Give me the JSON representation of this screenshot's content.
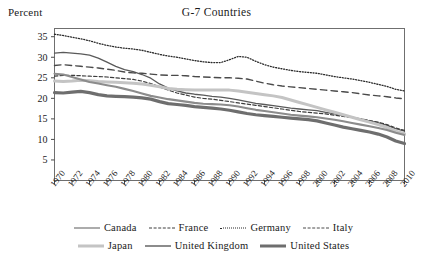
{
  "chart_data": {
    "type": "line",
    "title": "G-7 Countries",
    "ylabel": "Percent",
    "xlabel": "",
    "ylim": [
      0,
      37
    ],
    "xlim": [
      1970,
      2010
    ],
    "grid": false,
    "legend_position": "bottom",
    "yticks": [
      5,
      10,
      15,
      20,
      25,
      30,
      35
    ],
    "xticks": [
      1970,
      1972,
      1974,
      1976,
      1978,
      1980,
      1982,
      1984,
      1986,
      1988,
      1990,
      1992,
      1994,
      1996,
      1998,
      2000,
      2002,
      2004,
      2006,
      2008,
      2010
    ],
    "x": [
      1970,
      1971,
      1972,
      1973,
      1974,
      1975,
      1976,
      1977,
      1978,
      1979,
      1980,
      1981,
      1982,
      1983,
      1984,
      1985,
      1986,
      1987,
      1988,
      1989,
      1990,
      1991,
      1992,
      1993,
      1994,
      1995,
      1996,
      1997,
      1998,
      1999,
      2000,
      2001,
      2002,
      2003,
      2004,
      2005,
      2006,
      2007,
      2008,
      2009,
      2010
    ],
    "series": [
      {
        "name": "Canada",
        "style": "solid-thin",
        "color": "#5a5a5a",
        "width": 1.3,
        "values": [
          31.0,
          31.2,
          31.0,
          30.8,
          30.5,
          29.8,
          28.8,
          27.8,
          27.0,
          26.5,
          25.8,
          24.9,
          23.5,
          22.5,
          21.8,
          21.3,
          21.0,
          20.8,
          20.5,
          20.3,
          20.0,
          19.6,
          19.2,
          18.8,
          18.5,
          18.2,
          17.9,
          17.6,
          17.4,
          17.2,
          17.0,
          16.6,
          16.2,
          15.8,
          15.4,
          15.0,
          14.5,
          14.0,
          13.4,
          12.6,
          12.0
        ]
      },
      {
        "name": "France",
        "style": "dashed",
        "color": "#3d3d3d",
        "width": 1.2,
        "values": [
          25.4,
          25.6,
          25.6,
          25.5,
          25.4,
          25.3,
          25.2,
          25.0,
          24.8,
          24.6,
          24.2,
          23.6,
          22.8,
          22.0,
          21.3,
          20.8,
          20.3,
          20.0,
          19.8,
          19.5,
          19.2,
          18.9,
          18.6,
          18.3,
          18.0,
          17.7,
          17.4,
          17.1,
          16.8,
          16.6,
          16.4,
          16.2,
          15.9,
          15.6,
          15.3,
          15.0,
          14.6,
          14.2,
          13.6,
          12.8,
          12.2
        ]
      },
      {
        "name": "Germany",
        "style": "dotted",
        "color": "#2b2b2b",
        "width": 1.3,
        "values": [
          35.6,
          35.3,
          34.9,
          34.5,
          34.0,
          33.4,
          32.9,
          32.5,
          32.2,
          32.0,
          31.7,
          31.2,
          30.7,
          30.3,
          30.0,
          29.6,
          29.2,
          28.9,
          28.7,
          28.7,
          29.4,
          30.2,
          30.0,
          29.0,
          28.2,
          27.6,
          27.2,
          26.8,
          26.5,
          26.3,
          26.1,
          25.7,
          25.3,
          25.0,
          24.7,
          24.3,
          23.9,
          23.4,
          22.9,
          22.2,
          21.8
        ]
      },
      {
        "name": "Italy",
        "style": "longdash",
        "color": "#4a4a4a",
        "width": 1.4,
        "values": [
          28.0,
          28.2,
          28.0,
          27.8,
          27.6,
          27.4,
          27.1,
          26.8,
          26.4,
          26.2,
          26.1,
          25.9,
          25.7,
          25.6,
          25.6,
          25.5,
          25.3,
          25.2,
          25.1,
          25.0,
          25.0,
          24.9,
          24.7,
          24.2,
          23.7,
          23.3,
          23.0,
          22.8,
          22.6,
          22.4,
          22.2,
          22.0,
          21.8,
          21.6,
          21.4,
          21.1,
          20.8,
          20.6,
          20.4,
          20.1,
          19.9
        ]
      },
      {
        "name": "Japan",
        "style": "solid-thick",
        "color": "#c4c4c4",
        "width": 3.0,
        "values": [
          24.2,
          24.1,
          24.2,
          24.4,
          24.3,
          24.1,
          24.0,
          23.9,
          23.8,
          23.7,
          23.5,
          23.2,
          22.8,
          22.4,
          22.2,
          22.1,
          22.0,
          22.0,
          22.0,
          22.0,
          22.0,
          21.8,
          21.5,
          21.2,
          20.9,
          20.6,
          20.2,
          19.6,
          19.0,
          18.4,
          17.8,
          17.2,
          16.6,
          16.0,
          15.4,
          14.8,
          14.2,
          13.6,
          12.9,
          12.0,
          11.4
        ]
      },
      {
        "name": "United Kingdom",
        "style": "solid-med",
        "color": "#8c8c8c",
        "width": 2.1,
        "values": [
          26.0,
          25.8,
          25.2,
          24.6,
          24.0,
          23.6,
          23.2,
          22.8,
          22.3,
          21.8,
          21.2,
          20.6,
          20.2,
          19.8,
          19.5,
          19.2,
          18.9,
          18.7,
          18.6,
          18.5,
          18.3,
          18.0,
          17.6,
          17.2,
          16.9,
          16.6,
          16.3,
          16.0,
          15.8,
          15.6,
          15.4,
          15.1,
          14.8,
          14.4,
          14.0,
          13.6,
          13.2,
          12.8,
          12.3,
          11.6,
          11.1
        ]
      },
      {
        "name": "United States",
        "style": "solid-heavy",
        "color": "#6e6e6e",
        "width": 3.2,
        "values": [
          21.4,
          21.3,
          21.5,
          21.7,
          21.4,
          20.9,
          20.6,
          20.5,
          20.4,
          20.3,
          20.1,
          19.8,
          19.2,
          18.7,
          18.5,
          18.3,
          18.0,
          17.8,
          17.6,
          17.4,
          17.1,
          16.7,
          16.3,
          16.0,
          15.8,
          15.6,
          15.4,
          15.2,
          15.0,
          14.8,
          14.5,
          14.0,
          13.5,
          13.0,
          12.6,
          12.2,
          11.8,
          11.3,
          10.6,
          9.6,
          9.0
        ]
      }
    ],
    "legend": [
      {
        "label": "Canada"
      },
      {
        "label": "France"
      },
      {
        "label": "Germany"
      },
      {
        "label": "Italy"
      },
      {
        "label": "Japan"
      },
      {
        "label": "United Kingdom"
      },
      {
        "label": "United States"
      }
    ]
  }
}
